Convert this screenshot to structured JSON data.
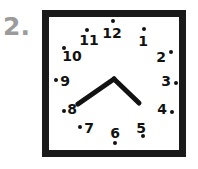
{
  "question": {
    "label": "2."
  },
  "clock": {
    "frame_color": "#1a1a1a",
    "face_color": "#ffffff",
    "numeral_color": "#121212",
    "hand_color": "#121212",
    "label_color": "#9b9b9b",
    "numerals": [
      {
        "value": "12",
        "nx": 112,
        "ny": 33,
        "dx": 113,
        "dy": 21
      },
      {
        "value": "1",
        "nx": 143,
        "ny": 41,
        "dx": 144,
        "dy": 29
      },
      {
        "value": "2",
        "nx": 161,
        "ny": 57,
        "dx": 171,
        "dy": 52
      },
      {
        "value": "3",
        "nx": 166,
        "ny": 81,
        "dx": 176,
        "dy": 83
      },
      {
        "value": "4",
        "nx": 162,
        "ny": 109,
        "dx": 172,
        "dy": 112
      },
      {
        "value": "5",
        "nx": 141,
        "ny": 128,
        "dx": 143,
        "dy": 136
      },
      {
        "value": "6",
        "nx": 115,
        "ny": 133,
        "dx": 115,
        "dy": 143
      },
      {
        "value": "7",
        "nx": 89,
        "ny": 128,
        "dx": 80,
        "dy": 127
      },
      {
        "value": "8",
        "nx": 72,
        "ny": 109,
        "dx": 64,
        "dy": 111
      },
      {
        "value": "9",
        "nx": 65,
        "ny": 81,
        "dx": 56,
        "dy": 80
      },
      {
        "value": "10",
        "nx": 72,
        "ny": 56,
        "dx": 64,
        "dy": 48
      },
      {
        "value": "11",
        "nx": 89,
        "ny": 40,
        "dx": 87,
        "dy": 30
      }
    ],
    "hands": {
      "center_x": 114,
      "center_y": 79,
      "minute": {
        "tip_x": 78,
        "tip_y": 104,
        "width": 5,
        "points_to": "8"
      },
      "hour": {
        "tip_x": 139,
        "tip_y": 103,
        "width": 5,
        "points_to": "4"
      }
    }
  }
}
